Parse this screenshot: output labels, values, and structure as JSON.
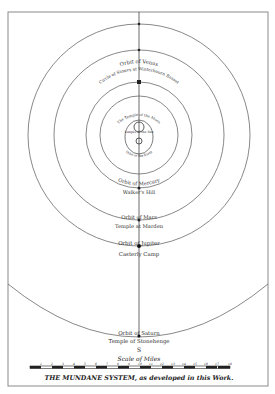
{
  "title": "THE MUNDANE SYSTEM, as developed in this Work.",
  "title_parts": {
    "caps": "THE MUNDANE SYSTEM,",
    "rest": "as developed in this Work."
  },
  "scale": {
    "label": "Scale of Miles",
    "ticks": [
      "1",
      "2",
      "3",
      "4",
      "5",
      "6",
      "7",
      "8",
      "9",
      "10",
      "11",
      "12",
      "13",
      "14",
      "15",
      "16",
      "17",
      "18"
    ]
  },
  "south_marker": "S",
  "labels": {
    "venus_orbit": "Orbit of Venus",
    "venus_site": "Circle of Stones at Winterbourn Basset",
    "moon_temple": "The Temple of the Moon",
    "sun_temple": "Temple of the Sun",
    "earth_orbit": "Orbit of the Earth",
    "mercury_orbit": "Orbit of Mercury",
    "mercury_site": "Walker's Hill",
    "mars_orbit": "Orbit of Mars",
    "mars_site": "Temple at Marden",
    "jupiter_orbit": "Orbit of Jupiter",
    "jupiter_site": "Casterly Camp",
    "saturn_orbit": "Orbit of Saturn",
    "saturn_site": "Temple of Stonehenge"
  },
  "colors": {
    "ink": "#333333",
    "frame": "#8a8a8a",
    "paper": "#ffffff"
  }
}
